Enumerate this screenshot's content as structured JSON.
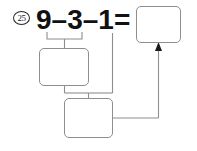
{
  "worksheet": {
    "problem_number": "25",
    "equation": {
      "operand_1": "9",
      "operator_1": "–",
      "operand_2": "3",
      "operator_2": "–",
      "operand_3": "1",
      "equals": "="
    },
    "boxes": [
      {
        "id": "box-top-right",
        "label": "",
        "value": ""
      },
      {
        "id": "box-middle",
        "label": "",
        "value": ""
      },
      {
        "id": "box-bottom",
        "label": "",
        "value": ""
      }
    ],
    "colors": {
      "ink": "#111111",
      "box_stroke": "#8e8e8e",
      "connector": "#8e8e8e",
      "arrow": "#1a1a1a",
      "background": "#ffffff"
    }
  }
}
